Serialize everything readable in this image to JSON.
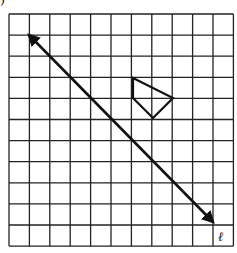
{
  "figure": {
    "part_label": ")",
    "grid": {
      "columns": 11,
      "rows": 11,
      "left": 9,
      "top": 14,
      "cell_w": 20.4,
      "cell_h": 21.1
    },
    "line": {
      "label": "ℓ",
      "from": [
        29,
        35
      ],
      "to": [
        213,
        222
      ]
    },
    "shape": {
      "points": [
        [
          133,
          78
        ],
        [
          173,
          98
        ],
        [
          153,
          118
        ],
        [
          133,
          98
        ]
      ]
    },
    "colors": {
      "ink": "#111111",
      "background": "#ffffff"
    }
  }
}
